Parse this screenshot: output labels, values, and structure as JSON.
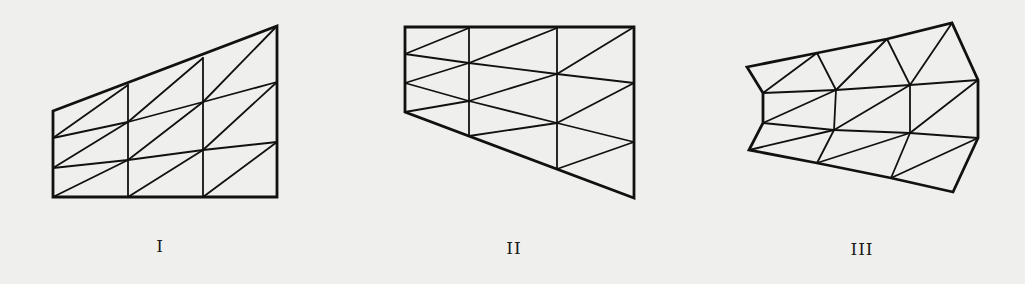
{
  "figure": {
    "background": "#efefed",
    "stroke_color": "#111111",
    "panels": [
      {
        "id": "panel-1",
        "label": "I",
        "label_pos": [
          160,
          236
        ],
        "outline": [
          [
            53,
            111
          ],
          [
            277,
            26
          ],
          [
            277,
            197
          ],
          [
            53,
            197
          ]
        ],
        "nodes": {
          "a0": [
            53,
            111
          ],
          "a1": [
            53,
            138
          ],
          "a2": [
            53,
            168
          ],
          "a3": [
            53,
            197
          ],
          "b0": [
            128,
            85
          ],
          "b1": [
            128,
            122
          ],
          "b2": [
            128,
            160
          ],
          "b3": [
            128,
            197
          ],
          "c0": [
            203,
            58
          ],
          "c1": [
            203,
            102
          ],
          "c2": [
            203,
            150
          ],
          "c3": [
            203,
            197
          ],
          "d0": [
            277,
            26
          ],
          "d1": [
            277,
            82
          ],
          "d2": [
            277,
            142
          ],
          "d3": [
            277,
            197
          ]
        },
        "edges": [
          [
            "b0",
            "b3"
          ],
          [
            "c0",
            "c3"
          ],
          [
            "a1",
            "b1"
          ],
          [
            "b1",
            "c1"
          ],
          [
            "c1",
            "d1"
          ],
          [
            "a2",
            "b2"
          ],
          [
            "b2",
            "c2"
          ],
          [
            "c2",
            "d2"
          ],
          [
            "a1",
            "b0"
          ],
          [
            "a2",
            "b1"
          ],
          [
            "a3",
            "b2"
          ],
          [
            "b1",
            "c0"
          ],
          [
            "b2",
            "c1"
          ],
          [
            "b3",
            "c2"
          ],
          [
            "c1",
            "d0"
          ],
          [
            "c2",
            "d1"
          ],
          [
            "c3",
            "d2"
          ]
        ]
      },
      {
        "id": "panel-2",
        "label": "II",
        "label_pos": [
          514,
          238
        ],
        "outline": [
          [
            405,
            27
          ],
          [
            634,
            27
          ],
          [
            634,
            198
          ],
          [
            405,
            112
          ]
        ],
        "nodes": {
          "a0": [
            405,
            27
          ],
          "a1": [
            405,
            54
          ],
          "a2": [
            405,
            83
          ],
          "a3": [
            405,
            112
          ],
          "b0": [
            469,
            28
          ],
          "b1": [
            469,
            63
          ],
          "b2": [
            469,
            101
          ],
          "b3": [
            469,
            136
          ],
          "c0": [
            557,
            28
          ],
          "c1": [
            557,
            74
          ],
          "c2": [
            557,
            123
          ],
          "c3": [
            557,
            169
          ],
          "d0": [
            634,
            27
          ],
          "d1": [
            634,
            83
          ],
          "d2": [
            634,
            142
          ],
          "d3": [
            634,
            198
          ]
        },
        "edges": [
          [
            "b0",
            "b3"
          ],
          [
            "c0",
            "c3"
          ],
          [
            "a1",
            "b1"
          ],
          [
            "b1",
            "c1"
          ],
          [
            "c1",
            "d1"
          ],
          [
            "a2",
            "b2"
          ],
          [
            "b2",
            "c2"
          ],
          [
            "c2",
            "d2"
          ],
          [
            "a1",
            "b0"
          ],
          [
            "a2",
            "b1"
          ],
          [
            "a3",
            "b2"
          ],
          [
            "b1",
            "c0"
          ],
          [
            "b2",
            "c1"
          ],
          [
            "b3",
            "c2"
          ],
          [
            "c1",
            "d0"
          ],
          [
            "c2",
            "d1"
          ],
          [
            "c3",
            "d2"
          ]
        ]
      },
      {
        "id": "panel-3",
        "label": "III",
        "label_pos": [
          862,
          239
        ],
        "outline": [
          [
            747,
            67
          ],
          [
            817,
            53
          ],
          [
            887,
            39
          ],
          [
            952,
            23
          ],
          [
            978,
            80
          ],
          [
            978,
            138
          ],
          [
            953,
            192
          ],
          [
            891,
            178
          ],
          [
            817,
            163
          ],
          [
            749,
            150
          ],
          [
            763,
            123
          ],
          [
            763,
            93
          ]
        ],
        "nodes": {
          "a0": [
            747,
            67
          ],
          "a1": [
            763,
            93
          ],
          "a2": [
            763,
            123
          ],
          "a3": [
            749,
            150
          ],
          "b0": [
            817,
            53
          ],
          "b1": [
            836,
            90
          ],
          "b2": [
            834,
            130
          ],
          "b3": [
            817,
            163
          ],
          "c0": [
            887,
            39
          ],
          "c1": [
            910,
            85
          ],
          "c2": [
            910,
            133
          ],
          "c3": [
            891,
            178
          ],
          "d0": [
            952,
            23
          ],
          "d1": [
            978,
            80
          ],
          "d2": [
            978,
            138
          ],
          "d3": [
            953,
            192
          ]
        },
        "edges": [
          [
            "b0",
            "b1"
          ],
          [
            "b1",
            "b2"
          ],
          [
            "b2",
            "b3"
          ],
          [
            "c0",
            "c1"
          ],
          [
            "c1",
            "c2"
          ],
          [
            "c2",
            "c3"
          ],
          [
            "a1",
            "b1"
          ],
          [
            "b1",
            "c1"
          ],
          [
            "c1",
            "d1"
          ],
          [
            "a2",
            "b2"
          ],
          [
            "b2",
            "c2"
          ],
          [
            "c2",
            "d2"
          ],
          [
            "a1",
            "b0"
          ],
          [
            "a2",
            "b1"
          ],
          [
            "a3",
            "b2"
          ],
          [
            "b1",
            "c0"
          ],
          [
            "b2",
            "c1"
          ],
          [
            "b3",
            "c2"
          ],
          [
            "c1",
            "d0"
          ],
          [
            "c2",
            "d1"
          ],
          [
            "c3",
            "d2"
          ]
        ]
      }
    ]
  }
}
